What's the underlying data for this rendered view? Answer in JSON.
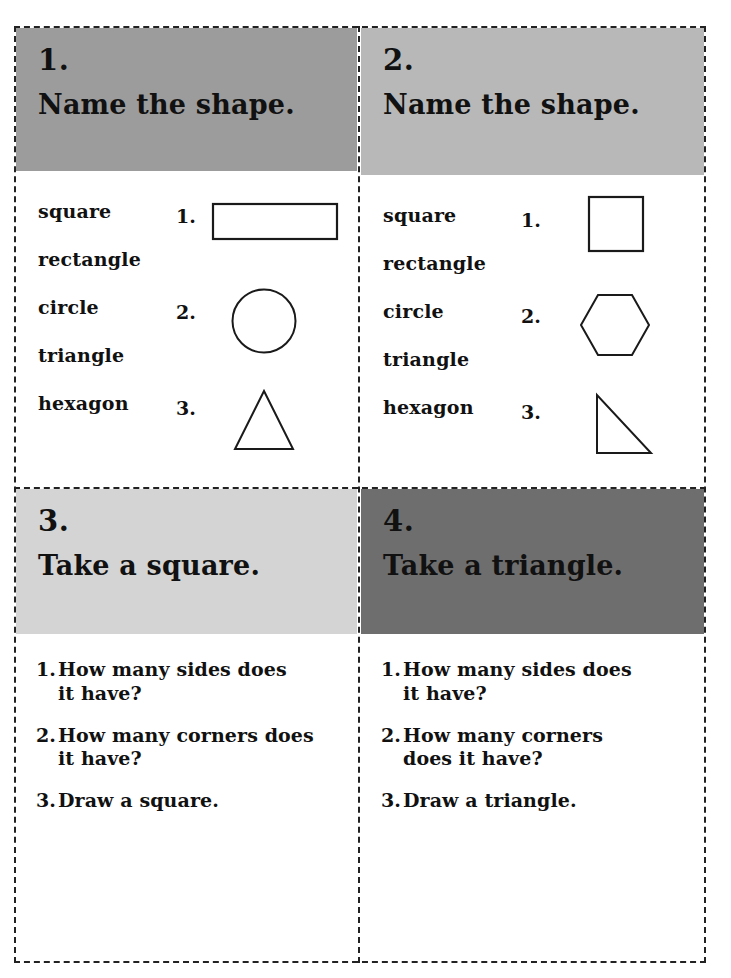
{
  "worksheet": {
    "cards": [
      {
        "number": "1.",
        "title": "Name the shape.",
        "header_color": "#9c9c9c",
        "type": "name-the-shape",
        "words": [
          "square",
          "rectangle",
          "circle",
          "triangle",
          "hexagon"
        ],
        "items": [
          {
            "number": "1.",
            "shape": "rectangle"
          },
          {
            "number": "2.",
            "shape": "circle"
          },
          {
            "number": "3.",
            "shape": "triangle"
          }
        ]
      },
      {
        "number": "2.",
        "title": "Name the shape.",
        "header_color": "#b8b8b8",
        "type": "name-the-shape",
        "words": [
          "square",
          "rectangle",
          "circle",
          "triangle",
          "hexagon"
        ],
        "items": [
          {
            "number": "1.",
            "shape": "square"
          },
          {
            "number": "2.",
            "shape": "hexagon"
          },
          {
            "number": "3.",
            "shape": "right-triangle"
          }
        ]
      },
      {
        "number": "3.",
        "title": "Take a square.",
        "header_color": "#d4d4d4",
        "type": "questions",
        "questions": [
          {
            "number": "1.",
            "text": "How many sides does\nit have?"
          },
          {
            "number": "2.",
            "text": "How many corners does\nit have?"
          },
          {
            "number": "3.",
            "text": "Draw a square."
          }
        ]
      },
      {
        "number": "4.",
        "title": "Take a triangle.",
        "header_color": "#6e6e6e",
        "type": "questions",
        "questions": [
          {
            "number": "1.",
            "text": "How many sides does\nit have?"
          },
          {
            "number": "2.",
            "text": "How many corners\ndoes it have?"
          },
          {
            "number": "3.",
            "text": "Draw a triangle."
          }
        ]
      }
    ],
    "colors": {
      "ink": "#111111",
      "cut_line": "#222222",
      "paper": "#ffffff"
    }
  }
}
